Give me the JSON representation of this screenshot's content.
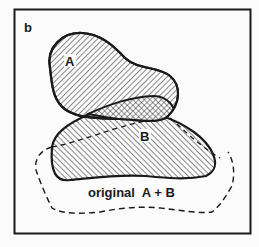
{
  "panel_label": "b",
  "shapes": {
    "a": {
      "label": "A",
      "fill": "diagonal-hatch"
    },
    "b": {
      "label": "B",
      "fill": "diagonal-hatch"
    },
    "overlap": {
      "fill": "crosshatch"
    },
    "original": {
      "label": "original  A + B",
      "stroke": "dashed"
    }
  },
  "colors": {
    "ink": "#1a1a1a",
    "background": "#fbfbfb"
  }
}
